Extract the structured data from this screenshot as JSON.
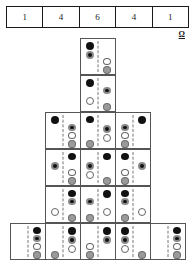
{
  "header": {
    "name": "binomial-coefficients-row",
    "cells": [
      "1",
      "4",
      "6",
      "4",
      "1"
    ]
  },
  "annotation": {
    "omega_label": "Ω"
  },
  "dot_types": {
    "solid": "#111111",
    "ring": "#111111",
    "ring_outline": "#8a8a8a",
    "open": "#ffffff",
    "open_outline": "#666666",
    "gray": "#9a9a9a",
    "gray_outline": "#6e6e6e"
  },
  "pyramid": {
    "description": "Pascal-style pyramid of four-dot domino tiles",
    "rows": [
      {
        "row_index": 0,
        "top": 0,
        "tiles": [
          {
            "left": [
              "solid",
              "ring"
            ],
            "right": [
              "empty",
              "empty",
              "open",
              "gray"
            ]
          }
        ]
      },
      {
        "row_index": 1,
        "top": 37,
        "tiles": [
          {
            "left": [
              "solid",
              "empty",
              "open"
            ],
            "right": [
              "empty",
              "ring",
              "empty",
              "gray"
            ]
          }
        ]
      },
      {
        "row_index": 2,
        "top": 74,
        "tiles": [
          {
            "left": [
              "solid"
            ],
            "right": [
              "empty",
              "ring",
              "open",
              "gray"
            ]
          },
          {
            "left": [
              "solid",
              "empty",
              "empty",
              "gray"
            ],
            "right": [
              "empty",
              "ring",
              "open"
            ]
          },
          {
            "left": [
              "empty",
              "ring",
              "open",
              "gray"
            ],
            "right": [
              "solid"
            ]
          }
        ]
      },
      {
        "row_index": 3,
        "top": 111,
        "tiles": [
          {
            "left": [
              "empty",
              "ring"
            ],
            "right": [
              "solid",
              "empty",
              "open",
              "gray"
            ]
          },
          {
            "left": [
              "empty",
              "ring",
              "open"
            ],
            "right": [
              "solid",
              "empty",
              "empty",
              "gray"
            ]
          },
          {
            "left": [
              "solid",
              "empty",
              "open",
              "gray"
            ],
            "right": [
              "empty",
              "ring"
            ]
          }
        ]
      },
      {
        "row_index": 4,
        "top": 148,
        "tiles": [
          {
            "left": [
              "empty",
              "empty",
              "open"
            ],
            "right": [
              "solid",
              "ring",
              "empty",
              "gray"
            ]
          },
          {
            "left": [
              "empty",
              "ring",
              "empty",
              "gray"
            ],
            "right": [
              "solid",
              "empty",
              "open"
            ]
          },
          {
            "left": [
              "solid",
              "ring",
              "empty",
              "gray"
            ],
            "right": [
              "empty",
              "empty",
              "open"
            ]
          }
        ]
      },
      {
        "row_index": 5,
        "top": 185,
        "tiles": [
          {
            "left": [],
            "right": [
              "solid",
              "ring",
              "open",
              "gray"
            ]
          },
          {
            "left": [
              "empty",
              "empty",
              "empty",
              "gray"
            ],
            "right": [
              "solid",
              "ring",
              "open"
            ]
          },
          {
            "left": [
              "empty",
              "empty",
              "open",
              "gray"
            ],
            "right": [
              "solid",
              "ring"
            ]
          },
          {
            "left": [
              "solid",
              "ring",
              "open"
            ],
            "right": [
              "empty",
              "empty",
              "empty",
              "gray"
            ]
          },
          {
            "left": [],
            "right": [
              "solid",
              "ring",
              "open",
              "gray"
            ]
          }
        ]
      }
    ]
  }
}
